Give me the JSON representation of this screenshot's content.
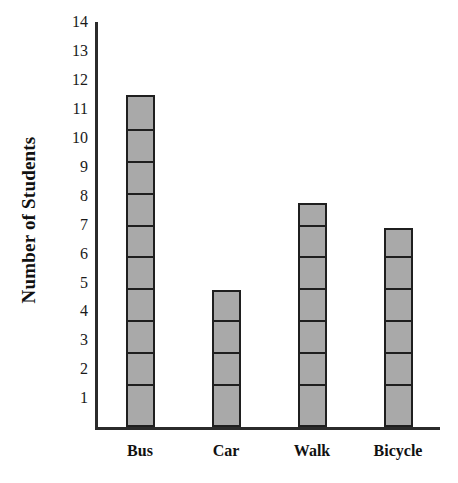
{
  "chart_data": {
    "type": "bar",
    "title": "",
    "subtitle": "",
    "xlabel": "",
    "ylabel": "Number of Students",
    "categories": [
      "Bus",
      "Car",
      "Walk",
      "Bicycle"
    ],
    "values": [
      11.5,
      4.75,
      7.75,
      6.9
    ],
    "series": [
      {
        "name": "Number of Students",
        "values": [
          11.5,
          4.75,
          7.75,
          6.9
        ]
      }
    ],
    "ylim": [
      0,
      14.4
    ],
    "ytick_labels": [
      "1",
      "2",
      "3",
      "4",
      "5",
      "6",
      "7",
      "8",
      "9",
      "10",
      "11",
      "12",
      "13",
      "14"
    ],
    "ytick_values": [
      1,
      2,
      3,
      4,
      5,
      6,
      7,
      8,
      9,
      10,
      11,
      12,
      13,
      14
    ],
    "grid": false,
    "legend": false,
    "legend_position": "none",
    "bar_style": "stacked-square-segments",
    "segment_unit": 1.1,
    "segment_origin": 1.5,
    "colors": {
      "bar_fill": "#a9a9a9",
      "bar_stroke": "#1f1f1f",
      "axis": "#2b2b2b",
      "text": "#111111",
      "background": "#ffffff"
    },
    "annotations": []
  },
  "axis": {
    "y_title": "Number of Students"
  }
}
